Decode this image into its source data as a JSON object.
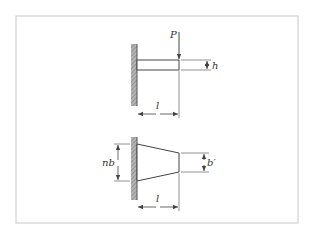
{
  "diagram": {
    "frame": {
      "x": 16,
      "y": 16,
      "width": 282,
      "height": 207,
      "stroke": "#c8c8c8"
    },
    "colors": {
      "line": "#444444",
      "wall": "#8a8a8a",
      "dim": "#555555"
    },
    "figure_top": {
      "description": "Cantilever beam of uniform depth with tip load",
      "labels": {
        "load": "P",
        "depth": "h",
        "length": "l"
      }
    },
    "figure_bottom": {
      "description": "Tapered cantilever beam (plan view)",
      "labels": {
        "root_width": "nb",
        "tip_width": "b′",
        "length": "l"
      }
    }
  }
}
